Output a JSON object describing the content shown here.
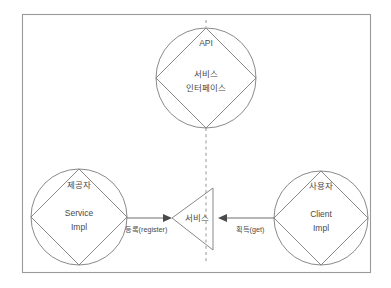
{
  "diagram": {
    "frame": {
      "label": "diagram-border"
    },
    "nodes": [
      {
        "id": "api",
        "title": "API",
        "body_line1": "서비스",
        "body_line2": "인터페이스"
      },
      {
        "id": "provider",
        "title": "제공자",
        "body_line1": "Service",
        "body_line2": "Impl"
      },
      {
        "id": "consumer",
        "title": "사용자",
        "body_line1": "Client",
        "body_line2": "Impl"
      }
    ],
    "center": {
      "label": "서비스"
    },
    "edges": [
      {
        "id": "register",
        "label": "등록(register)"
      },
      {
        "id": "get",
        "label": "획득(get)"
      }
    ],
    "colors": {
      "background": "#ffffff",
      "stroke": "#7d7d7d",
      "frame": "#9a9a9a",
      "text": "#4a4a4a",
      "arrow": "#4a4a4a"
    }
  }
}
